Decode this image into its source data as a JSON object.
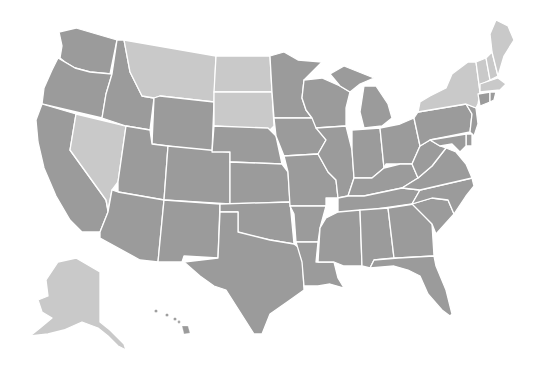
{
  "map": {
    "title": "United States",
    "colors": {
      "dark": "#9b9b9b",
      "light": "#c9c9c9",
      "border": "#ffffff",
      "background": "#ffffff"
    },
    "legend_groups": {
      "light": [
        "Montana",
        "North Dakota",
        "South Dakota",
        "Nevada",
        "New York",
        "Vermont",
        "New Hampshire",
        "Maine",
        "Massachusetts",
        "Alaska"
      ],
      "dark": [
        "Washington",
        "Oregon",
        "California",
        "Idaho",
        "Wyoming",
        "Utah",
        "Arizona",
        "Colorado",
        "New Mexico",
        "Nebraska",
        "Kansas",
        "Oklahoma",
        "Texas",
        "Minnesota",
        "Iowa",
        "Missouri",
        "Arkansas",
        "Louisiana",
        "Wisconsin",
        "Illinois",
        "Michigan",
        "Indiana",
        "Ohio",
        "Kentucky",
        "Tennessee",
        "Mississippi",
        "Alabama",
        "Georgia",
        "Florida",
        "South Carolina",
        "North Carolina",
        "Virginia",
        "West Virginia",
        "Pennsylvania",
        "New Jersey",
        "Delaware",
        "Maryland",
        "Connecticut",
        "Rhode Island",
        "Hawaii"
      ]
    }
  }
}
